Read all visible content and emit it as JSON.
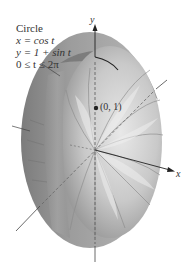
{
  "figure": {
    "caption": {
      "title": "Circle",
      "eq_x": "x = cos t",
      "eq_y": "y = 1 + sin t",
      "range": "0 ≤ t ≤ 2π"
    },
    "axes": {
      "y_label": "y",
      "x_label": "x"
    },
    "point": {
      "label": "(0, 1)"
    },
    "colors": {
      "surface_dark": "#8a8a8a",
      "surface_mid": "#a8a8a8",
      "surface_light": "#d6d6d6",
      "band_top": "#6e6e6e",
      "axis": "#222222",
      "dashed": "#555555",
      "text": "#333333"
    }
  }
}
